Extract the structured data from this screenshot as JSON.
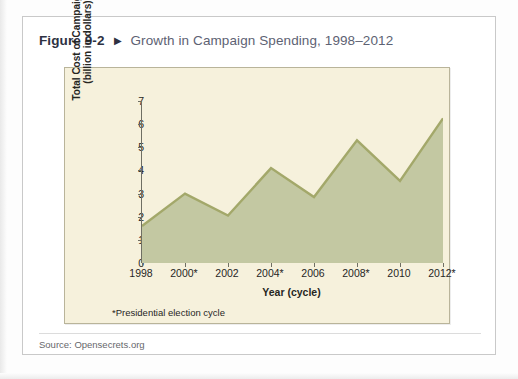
{
  "figure": {
    "number": "Figure 9-2",
    "arrow_icon": "triangle-right-icon",
    "title": "Growth in Campaign Spending, 1998–2012",
    "source": "Source: Opensecrets.org",
    "footnote": "*Presidential election cycle"
  },
  "colors": {
    "card_background": "#ffffff",
    "card_border": "#c9c9c9",
    "panel_background": "#f6f1dc",
    "panel_border": "#b9b49a",
    "area_fill": "#c3c8a2",
    "line_stroke": "#a3a86a",
    "axis": "#6f6f63",
    "figure_number_text": "#2d3142",
    "figure_title_text": "#5d6273",
    "source_text": "#66676b"
  },
  "chart_data": {
    "type": "area",
    "title": "Growth in Campaign Spending, 1998–2012",
    "xlabel": "Year (cycle)",
    "ylabel": "Total Cost of Campaigns\n(billion in dollars)",
    "ylabel_line1": "Total Cost of Campaigns",
    "ylabel_line2": "(billion in dollars)",
    "categories": [
      "1998",
      "2000*",
      "2002",
      "2004*",
      "2006",
      "2008*",
      "2010",
      "2012*"
    ],
    "values": [
      1.6,
      3.0,
      2.05,
      4.1,
      2.85,
      5.3,
      3.55,
      6.25
    ],
    "xtick_labels": [
      "1998",
      "2000*",
      "2002",
      "2004*",
      "2006",
      "2008*",
      "2010",
      "2012*"
    ],
    "ytick_labels": [
      "0",
      "1",
      "2",
      "3",
      "4",
      "5",
      "6",
      "7"
    ],
    "ytick_values": [
      0,
      1,
      2,
      3,
      4,
      5,
      6,
      7
    ],
    "ylim": [
      0,
      7
    ],
    "grid": false,
    "legend": false,
    "annotations": [
      "*Presidential election cycle"
    ]
  }
}
